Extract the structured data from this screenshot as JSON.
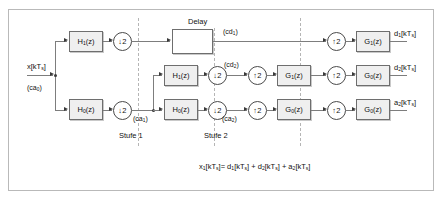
{
  "diagram": {
    "stages": {
      "stage1_label": "Stufe 1",
      "stage2_label": "Stufe 2"
    },
    "delay_label": "Delay",
    "input": {
      "signal": "x[kTs]",
      "coeff": "(ca0)"
    },
    "blocks": {
      "h1": "H1(z)",
      "h0": "H0(z)",
      "g1": "G1(z)",
      "g0": "G0(z)",
      "down2": "2",
      "up2": "2",
      "down_glyph": "↓",
      "up_glyph": "↑"
    },
    "signals": {
      "ca1": "(ca1)",
      "cd1": "(cd1)",
      "cd2": "(cd2)",
      "ca2": "(ca2)"
    },
    "outputs": {
      "d1": "d1[kTs]",
      "d2": "d2[kTs]",
      "a2": "a2[kTs]"
    },
    "equation": "x1[kTs]= d1[kTs] + d2[kTs] + a2[kTs]",
    "colors": {
      "block_fill": "#efefef",
      "block_border": "#6e6e6e",
      "line": "#7d7d7d",
      "frame": "#b9b9b9",
      "dashed_divider": "#b5b5b5"
    }
  }
}
